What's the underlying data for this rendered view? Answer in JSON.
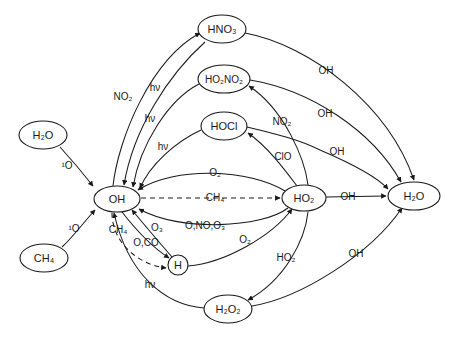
{
  "diagram": {
    "background_color": "#ffffff",
    "stroke_color": "#1a1a1a",
    "width": 449,
    "height": 341,
    "nodes": [
      {
        "id": "hno3",
        "label": "HNO3",
        "display": "HNO₃",
        "cx": 222,
        "cy": 29,
        "rx": 24,
        "ry": 14
      },
      {
        "id": "ho2no2",
        "label": "HO2NO2",
        "display": "HO₂NO₂",
        "cx": 224,
        "cy": 79,
        "rx": 26,
        "ry": 14
      },
      {
        "id": "hocl",
        "label": "HOCl",
        "display": "HOCl",
        "cx": 224,
        "cy": 126,
        "rx": 23,
        "ry": 14
      },
      {
        "id": "h2o_l",
        "label": "H2O",
        "display": "H₂O",
        "cx": 43,
        "cy": 135,
        "rx": 24,
        "ry": 14
      },
      {
        "id": "ch4_l",
        "label": "CH4",
        "display": "CH₄",
        "cx": 44,
        "cy": 258,
        "rx": 24,
        "ry": 14
      },
      {
        "id": "oh",
        "label": "OH",
        "display": "OH",
        "cx": 117,
        "cy": 199,
        "rx": 23,
        "ry": 13
      },
      {
        "id": "ho2",
        "label": "HO2",
        "display": "HO₂",
        "cx": 304,
        "cy": 198,
        "rx": 22,
        "ry": 13
      },
      {
        "id": "h2o_r",
        "label": "H2O",
        "display": "H₂O",
        "cx": 414,
        "cy": 196,
        "rx": 26,
        "ry": 14
      },
      {
        "id": "h",
        "label": "H",
        "display": "H",
        "cx": 178,
        "cy": 265,
        "rx": 10,
        "ry": 10
      },
      {
        "id": "h2o2",
        "label": "H2O2",
        "display": "H₂O₂",
        "cx": 228,
        "cy": 309,
        "rx": 24,
        "ry": 14
      }
    ],
    "edges": [
      {
        "id": "oh-to-hno3",
        "from": "oh",
        "to": "hno3",
        "label": "NO2",
        "display": "NO₂",
        "label_x": 123,
        "label_y": 97,
        "style": "solid"
      },
      {
        "id": "hno3-to-oh",
        "from": "hno3",
        "to": "oh",
        "label": "hv",
        "display": "hν",
        "label_x": 155,
        "label_y": 88,
        "style": "solid"
      },
      {
        "id": "ho2no2-to-oh",
        "from": "ho2no2",
        "to": "oh",
        "label": "hv",
        "display": "hν",
        "label_x": 150,
        "label_y": 119,
        "style": "solid"
      },
      {
        "id": "hocl-to-oh",
        "from": "hocl",
        "to": "oh",
        "label": "hv",
        "display": "hν",
        "label_x": 163,
        "label_y": 147,
        "style": "solid"
      },
      {
        "id": "h2ol-to-oh",
        "from": "h2o_l",
        "to": "oh",
        "label": "1O",
        "display": "¹O",
        "label_x": 67,
        "label_y": 166,
        "style": "solid"
      },
      {
        "id": "ch4l-to-oh",
        "from": "ch4_l",
        "to": "oh",
        "label": "1O",
        "display": "¹O",
        "label_x": 74,
        "label_y": 229,
        "style": "solid"
      },
      {
        "id": "ho2-to-oh-o2",
        "from": "ho2",
        "to": "oh",
        "label": "O2",
        "display": "O₂",
        "label_x": 215,
        "label_y": 173,
        "style": "solid"
      },
      {
        "id": "oh-to-ho2-ch4",
        "from": "oh",
        "to": "ho2",
        "label": "CH4",
        "display": "CH₄",
        "label_x": 215,
        "label_y": 198,
        "style": "dashed"
      },
      {
        "id": "ho2-to-oh-onoo3",
        "from": "ho2",
        "to": "oh",
        "label": "O,NO,O3",
        "display": "O,NO,O₃",
        "label_x": 205,
        "label_y": 226,
        "style": "solid"
      },
      {
        "id": "oh-to-h-ch4",
        "from": "oh",
        "to": "h",
        "label": "CH4",
        "display": "CH₄",
        "label_x": 118,
        "label_y": 230,
        "style": "dashed"
      },
      {
        "id": "h-to-oh-o3",
        "from": "h",
        "to": "oh",
        "label": "O3",
        "display": "O₃",
        "label_x": 157,
        "label_y": 228,
        "style": "solid"
      },
      {
        "id": "oh-to-h-oco",
        "from": "oh",
        "to": "h",
        "label": "O,CO",
        "display": "O,CO",
        "label_x": 146,
        "label_y": 243,
        "style": "solid"
      },
      {
        "id": "h-to-ho2-o2",
        "from": "h",
        "to": "ho2",
        "label": "O2",
        "display": "O₂",
        "label_x": 245,
        "label_y": 240,
        "style": "solid"
      },
      {
        "id": "ho2-to-ho2no2",
        "from": "ho2",
        "to": "ho2no2",
        "label": "NO2",
        "display": "NO₂",
        "label_x": 282,
        "label_y": 122,
        "style": "solid"
      },
      {
        "id": "ho2-to-hocl",
        "from": "ho2",
        "to": "hocl",
        "label": "ClO",
        "display": "ClO",
        "label_x": 283,
        "label_y": 157,
        "style": "solid"
      },
      {
        "id": "hno3-to-h2or",
        "from": "hno3",
        "to": "h2o_r",
        "label": "OH",
        "display": "OH",
        "label_x": 326,
        "label_y": 71,
        "style": "solid"
      },
      {
        "id": "ho2no2-to-h2or",
        "from": "ho2no2",
        "to": "h2o_r",
        "label": "OH",
        "display": "OH",
        "label_x": 325,
        "label_y": 114,
        "style": "solid"
      },
      {
        "id": "hocl-to-h2or",
        "from": "hocl",
        "to": "h2o_r",
        "label": "OH",
        "display": "OH",
        "label_x": 337,
        "label_y": 152,
        "style": "solid"
      },
      {
        "id": "ho2-to-h2or",
        "from": "ho2",
        "to": "h2o_r",
        "label": "OH",
        "display": "OH",
        "label_x": 348,
        "label_y": 197,
        "style": "solid"
      },
      {
        "id": "ho2-to-h2o2",
        "from": "ho2",
        "to": "h2o2",
        "label": "HO2",
        "display": "HO₂",
        "label_x": 286,
        "label_y": 258,
        "style": "solid"
      },
      {
        "id": "h2o2-to-oh",
        "from": "h2o2",
        "to": "oh",
        "label": "hv",
        "display": "hν",
        "label_x": 150,
        "label_y": 285,
        "style": "solid"
      },
      {
        "id": "h2o2-to-h2or",
        "from": "h2o2",
        "to": "h2o_r",
        "label": "OH",
        "display": "OH",
        "label_x": 356,
        "label_y": 254,
        "style": "solid"
      }
    ]
  }
}
